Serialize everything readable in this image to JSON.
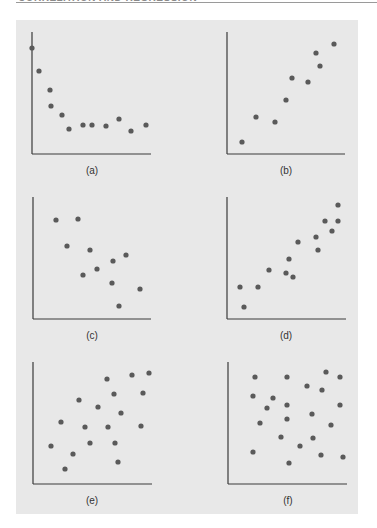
{
  "header": {
    "running_title": "CORRELATION AND REGRESSION"
  },
  "figure": {
    "background": "#e8e8e8",
    "point_color": "#5a5a5a",
    "axis_color": "#3a3a3a"
  },
  "chart_data": [
    {
      "type": "scatter",
      "label": "(a)",
      "description": "Curvilinear decreasing relationship leveling off",
      "axes": {
        "x0": 32,
        "y0": 154,
        "x1": 151,
        "ytop": 32
      },
      "label_pos": [
        92,
        174
      ],
      "points": [
        [
          32,
          48
        ],
        [
          39,
          71
        ],
        [
          50,
          90
        ],
        [
          51,
          106
        ],
        [
          62,
          115
        ],
        [
          69,
          129
        ],
        [
          83,
          125
        ],
        [
          92,
          125
        ],
        [
          106,
          126
        ],
        [
          119,
          119
        ],
        [
          131,
          131
        ],
        [
          146,
          125
        ]
      ]
    },
    {
      "type": "scatter",
      "label": "(b)",
      "description": "Positive linear relationship",
      "axes": {
        "x0": 227,
        "y0": 154,
        "x1": 345,
        "ytop": 32
      },
      "label_pos": [
        286,
        174
      ],
      "points": [
        [
          242,
          142
        ],
        [
          256,
          117
        ],
        [
          275,
          122
        ],
        [
          286,
          100
        ],
        [
          292,
          78
        ],
        [
          308,
          82
        ],
        [
          316,
          53
        ],
        [
          320,
          66
        ],
        [
          334,
          44
        ]
      ]
    },
    {
      "type": "scatter",
      "label": "(c)",
      "description": "Negative linear relationship",
      "axes": {
        "x0": 33,
        "y0": 319,
        "x1": 151,
        "ytop": 197
      },
      "label_pos": [
        92,
        339
      ],
      "points": [
        [
          56,
          220
        ],
        [
          78,
          219
        ],
        [
          67,
          246
        ],
        [
          90,
          250
        ],
        [
          113,
          261
        ],
        [
          97,
          269
        ],
        [
          126,
          255
        ],
        [
          83,
          275
        ],
        [
          112,
          283
        ],
        [
          140,
          289
        ],
        [
          119,
          306
        ]
      ]
    },
    {
      "type": "scatter",
      "label": "(d)",
      "description": "Strong positive linear relationship",
      "axes": {
        "x0": 227,
        "y0": 319,
        "x1": 346,
        "ytop": 197
      },
      "label_pos": [
        286,
        339
      ],
      "points": [
        [
          240,
          287
        ],
        [
          244,
          307
        ],
        [
          258,
          287
        ],
        [
          269,
          270
        ],
        [
          286,
          273
        ],
        [
          289,
          259
        ],
        [
          293,
          277
        ],
        [
          298,
          242
        ],
        [
          316,
          237
        ],
        [
          318,
          250
        ],
        [
          325,
          221
        ],
        [
          332,
          231
        ],
        [
          338,
          221
        ],
        [
          338,
          205
        ]
      ]
    },
    {
      "type": "scatter",
      "label": "(e)",
      "description": "Weak positive relationship",
      "axes": {
        "x0": 33,
        "y0": 484,
        "x1": 152,
        "ytop": 362
      },
      "label_pos": [
        92,
        504
      ],
      "points": [
        [
          107,
          379
        ],
        [
          132,
          375
        ],
        [
          149,
          373
        ],
        [
          143,
          393
        ],
        [
          114,
          394
        ],
        [
          79,
          400
        ],
        [
          98,
          407
        ],
        [
          121,
          413
        ],
        [
          61,
          422
        ],
        [
          85,
          427
        ],
        [
          108,
          427
        ],
        [
          141,
          426
        ],
        [
          51,
          446
        ],
        [
          90,
          443
        ],
        [
          115,
          443
        ],
        [
          73,
          454
        ],
        [
          118,
          462
        ],
        [
          65,
          469
        ]
      ]
    },
    {
      "type": "scatter",
      "label": "(f)",
      "description": "No relationship",
      "axes": {
        "x0": 228,
        "y0": 484,
        "x1": 347,
        "ytop": 362
      },
      "label_pos": [
        288,
        504
      ],
      "points": [
        [
          255,
          377
        ],
        [
          287,
          377
        ],
        [
          326,
          372
        ],
        [
          340,
          377
        ],
        [
          307,
          386
        ],
        [
          322,
          390
        ],
        [
          253,
          396
        ],
        [
          273,
          398
        ],
        [
          267,
          408
        ],
        [
          287,
          405
        ],
        [
          340,
          405
        ],
        [
          312,
          414
        ],
        [
          287,
          419
        ],
        [
          260,
          423
        ],
        [
          331,
          425
        ],
        [
          281,
          437
        ],
        [
          313,
          438
        ],
        [
          300,
          446
        ],
        [
          253,
          452
        ],
        [
          321,
          455
        ],
        [
          343,
          457
        ],
        [
          289,
          463
        ]
      ]
    }
  ]
}
